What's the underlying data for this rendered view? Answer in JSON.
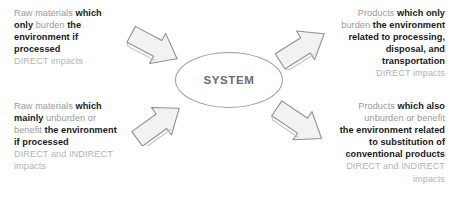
{
  "diagram": {
    "center": {
      "label": "SYSTEM",
      "shape": "ellipse",
      "stroke_color": "#9d9d9d",
      "text_color": "#6d6d6d"
    },
    "colors": {
      "gray_text": "#9a9a9a",
      "bold_text": "#1a1a1a",
      "faint_text": "#b4b4b4",
      "arrow_fill": "#f0f0f0",
      "arrow_stroke": "#8f8f8f",
      "background": "#ffffff"
    },
    "blocks": {
      "top_left": {
        "position": "top-left",
        "align": "left",
        "direction": "input",
        "lines": [
          [
            {
              "t": "Raw materials ",
              "s": "gray"
            },
            {
              "t": "which",
              "s": "bold"
            }
          ],
          [
            {
              "t": "only ",
              "s": "bold"
            },
            {
              "t": "burden ",
              "s": "gray"
            },
            {
              "t": "the",
              "s": "bold"
            }
          ],
          [
            {
              "t": "environment if",
              "s": "bold"
            }
          ],
          [
            {
              "t": "processed",
              "s": "bold"
            }
          ],
          [
            {
              "t": "DIRECT impacts",
              "s": "faint"
            }
          ]
        ]
      },
      "top_right": {
        "position": "top-right",
        "align": "right",
        "direction": "output",
        "lines": [
          [
            {
              "t": "Products ",
              "s": "gray"
            },
            {
              "t": "which only",
              "s": "bold"
            }
          ],
          [
            {
              "t": "burden ",
              "s": "gray"
            },
            {
              "t": "the environment",
              "s": "bold"
            }
          ],
          [
            {
              "t": "related to processing,",
              "s": "bold"
            }
          ],
          [
            {
              "t": "disposal, and",
              "s": "bold"
            }
          ],
          [
            {
              "t": "transportation",
              "s": "bold"
            }
          ],
          [
            {
              "t": "DIRECT impacts",
              "s": "faint"
            }
          ]
        ]
      },
      "bottom_left": {
        "position": "bottom-left",
        "align": "left",
        "direction": "input",
        "lines": [
          [
            {
              "t": "Raw materials ",
              "s": "gray"
            },
            {
              "t": "which",
              "s": "bold"
            }
          ],
          [
            {
              "t": "mainly ",
              "s": "bold"
            },
            {
              "t": "unburden or",
              "s": "gray"
            }
          ],
          [
            {
              "t": "benefit ",
              "s": "gray"
            },
            {
              "t": "the environment",
              "s": "bold"
            }
          ],
          [
            {
              "t": "if processed",
              "s": "bold"
            }
          ],
          [
            {
              "t": "DIRECT and INDIRECT",
              "s": "faint"
            }
          ],
          [
            {
              "t": "impacts",
              "s": "faint"
            }
          ]
        ]
      },
      "bottom_right": {
        "position": "bottom-right",
        "align": "right",
        "direction": "output",
        "lines": [
          [
            {
              "t": "Products ",
              "s": "gray"
            },
            {
              "t": "which also",
              "s": "bold"
            }
          ],
          [
            {
              "t": "unburden or benefit",
              "s": "gray"
            }
          ],
          [
            {
              "t": "the environment related",
              "s": "bold"
            }
          ],
          [
            {
              "t": "to substitution of",
              "s": "bold"
            }
          ],
          [
            {
              "t": "conventional products",
              "s": "bold"
            }
          ],
          [
            {
              "t": "DIRECT and INDIRECT",
              "s": "faint"
            }
          ],
          [
            {
              "t": "impacts",
              "s": "faint"
            }
          ]
        ]
      }
    },
    "arrows": [
      {
        "name": "arrow-input-top",
        "points": "down-right",
        "from": "top-left text",
        "to": "system"
      },
      {
        "name": "arrow-output-top",
        "points": "up-right",
        "from": "system",
        "to": "top-right text"
      },
      {
        "name": "arrow-input-bottom",
        "points": "up-right",
        "from": "bottom-left text",
        "to": "system"
      },
      {
        "name": "arrow-output-bottom",
        "points": "down-right",
        "from": "system",
        "to": "bottom-right text"
      }
    ]
  }
}
